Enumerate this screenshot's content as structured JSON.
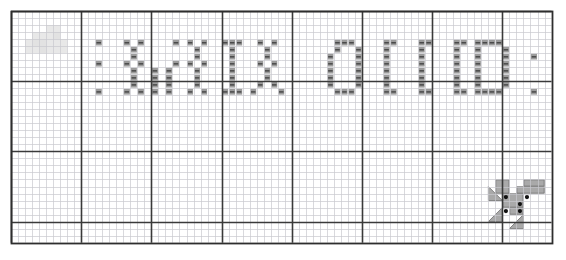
{
  "document": {
    "kind": "cross-stitch-pattern-chart",
    "title": "Cross Stitch Pattern Chart",
    "background_color": "#ffffff"
  },
  "grid": {
    "origin_x": 11,
    "origin_y": 11,
    "cell_size": 7.02,
    "columns": 77,
    "rows": 33,
    "bold_every": 10,
    "minor_line_color": "#c9c9cf",
    "major_line_color": "#3a3a3a",
    "border_color": "#2e2e2e",
    "minor_line_width": 0.7,
    "major_line_width": 1.6,
    "border_width": 1.8
  },
  "symbols": {
    "stitch_fill": "#8a8a8a",
    "stitch_dash_color": "#4a4a4a",
    "stitch_cell_inset": 1.2,
    "description": "Each filled cell is drawn as a light grey square with a short dark horizontal dash through its centre."
  },
  "watermark": {
    "label": "faint-grey-block-watermark",
    "color": "#e0e0e0",
    "opacity": 0.75,
    "blocks": [
      {
        "col": 3,
        "row": 3,
        "w": 2,
        "h": 2
      },
      {
        "col": 5,
        "row": 2,
        "w": 2,
        "h": 3
      },
      {
        "col": 2,
        "row": 4,
        "w": 3,
        "h": 2
      },
      {
        "col": 7,
        "row": 4,
        "w": 1,
        "h": 1
      },
      {
        "col": 4,
        "row": 5,
        "w": 4,
        "h": 1
      },
      {
        "col": 6,
        "row": 3,
        "w": 1,
        "h": 1
      }
    ]
  },
  "logo_mark": {
    "label": "paw-print-mark",
    "grey_color": "#a9a9a9",
    "grey_edge": "#6f6f6f",
    "dot_color": "#111111",
    "pads": [
      {
        "col": 69,
        "row": 24,
        "w": 2,
        "h": 2
      },
      {
        "col": 73,
        "row": 24,
        "w": 3,
        "h": 1
      },
      {
        "col": 72,
        "row": 25,
        "w": 4,
        "h": 1
      },
      {
        "col": 70,
        "row": 26,
        "w": 3,
        "h": 2
      },
      {
        "col": 71,
        "row": 28,
        "w": 2,
        "h": 1
      }
    ],
    "claws": [
      {
        "col": 68,
        "row": 25,
        "w": 2,
        "h": 2,
        "dir": "nw"
      },
      {
        "col": 68,
        "row": 28,
        "w": 2,
        "h": 2,
        "dir": "sw"
      },
      {
        "col": 71,
        "row": 29,
        "w": 2,
        "h": 2,
        "dir": "se"
      }
    ],
    "dots": [
      {
        "col": 70,
        "row": 26
      },
      {
        "col": 73,
        "row": 26
      },
      {
        "col": 72,
        "row": 27
      },
      {
        "col": 70,
        "row": 28
      },
      {
        "col": 72,
        "row": 28
      }
    ]
  },
  "chart_data": {
    "type": "heatmap",
    "title": "Cross Stitch Pattern Chart",
    "xlabel": "",
    "ylabel": "",
    "grid": true,
    "legend": "none",
    "columns": 77,
    "rows": 33,
    "palette": {
      "empty": "#ffffff",
      "stitch": "#8a8a8a",
      "watermark": "#e0e0e0",
      "mark_grey": "#a9a9a9",
      "mark_dot": "#111111"
    },
    "lettering_band": {
      "row_top": 4,
      "row_bottom": 12,
      "note": "Stitched glyph band running across the upper half of the chart."
    },
    "stitches": [
      [
        16,
        4
      ],
      [
        18,
        4
      ],
      [
        23,
        4
      ],
      [
        25,
        4
      ],
      [
        27,
        4
      ],
      [
        30,
        4
      ],
      [
        31,
        4
      ],
      [
        32,
        4
      ],
      [
        35,
        4
      ],
      [
        37,
        4
      ],
      [
        46,
        4
      ],
      [
        47,
        4
      ],
      [
        48,
        4
      ],
      [
        53,
        4
      ],
      [
        54,
        4
      ],
      [
        58,
        4
      ],
      [
        59,
        4
      ],
      [
        63,
        4
      ],
      [
        64,
        4
      ],
      [
        66,
        4
      ],
      [
        67,
        4
      ],
      [
        68,
        4
      ],
      [
        69,
        4
      ],
      [
        17,
        5
      ],
      [
        26,
        5
      ],
      [
        31,
        5
      ],
      [
        36,
        5
      ],
      [
        46,
        5
      ],
      [
        49,
        5
      ],
      [
        53,
        5
      ],
      [
        58,
        5
      ],
      [
        63,
        5
      ],
      [
        66,
        5
      ],
      [
        70,
        5
      ],
      [
        17,
        6
      ],
      [
        26,
        6
      ],
      [
        31,
        6
      ],
      [
        36,
        6
      ],
      [
        45,
        6
      ],
      [
        49,
        6
      ],
      [
        53,
        6
      ],
      [
        58,
        6
      ],
      [
        63,
        6
      ],
      [
        66,
        6
      ],
      [
        70,
        6
      ],
      [
        16,
        7
      ],
      [
        18,
        7
      ],
      [
        23,
        7
      ],
      [
        25,
        7
      ],
      [
        27,
        7
      ],
      [
        31,
        7
      ],
      [
        35,
        7
      ],
      [
        37,
        7
      ],
      [
        45,
        7
      ],
      [
        49,
        7
      ],
      [
        53,
        7
      ],
      [
        58,
        7
      ],
      [
        63,
        7
      ],
      [
        66,
        7
      ],
      [
        70,
        7
      ],
      [
        17,
        8
      ],
      [
        20,
        8
      ],
      [
        22,
        8
      ],
      [
        26,
        8
      ],
      [
        31,
        8
      ],
      [
        36,
        8
      ],
      [
        45,
        8
      ],
      [
        49,
        8
      ],
      [
        53,
        8
      ],
      [
        58,
        8
      ],
      [
        63,
        8
      ],
      [
        66,
        8
      ],
      [
        70,
        8
      ],
      [
        17,
        9
      ],
      [
        20,
        9
      ],
      [
        22,
        9
      ],
      [
        26,
        9
      ],
      [
        31,
        9
      ],
      [
        36,
        9
      ],
      [
        45,
        9
      ],
      [
        49,
        9
      ],
      [
        53,
        9
      ],
      [
        58,
        9
      ],
      [
        63,
        9
      ],
      [
        66,
        9
      ],
      [
        70,
        9
      ],
      [
        17,
        10
      ],
      [
        20,
        10
      ],
      [
        22,
        10
      ],
      [
        26,
        10
      ],
      [
        31,
        10
      ],
      [
        35,
        10
      ],
      [
        37,
        10
      ],
      [
        45,
        10
      ],
      [
        49,
        10
      ],
      [
        53,
        10
      ],
      [
        58,
        10
      ],
      [
        63,
        10
      ],
      [
        66,
        10
      ],
      [
        70,
        10
      ],
      [
        16,
        11
      ],
      [
        18,
        11
      ],
      [
        20,
        11
      ],
      [
        22,
        11
      ],
      [
        25,
        11
      ],
      [
        27,
        11
      ],
      [
        30,
        11
      ],
      [
        31,
        11
      ],
      [
        32,
        11
      ],
      [
        34,
        11
      ],
      [
        38,
        11
      ],
      [
        46,
        11
      ],
      [
        47,
        11
      ],
      [
        48,
        11
      ],
      [
        53,
        11
      ],
      [
        54,
        11
      ],
      [
        58,
        11
      ],
      [
        59,
        11
      ],
      [
        63,
        11
      ],
      [
        64,
        11
      ],
      [
        66,
        11
      ],
      [
        67,
        11
      ],
      [
        68,
        11
      ],
      [
        69,
        11
      ],
      [
        12,
        4
      ],
      [
        12,
        7
      ],
      [
        12,
        11
      ],
      [
        74,
        6
      ],
      [
        74,
        11
      ]
    ]
  }
}
